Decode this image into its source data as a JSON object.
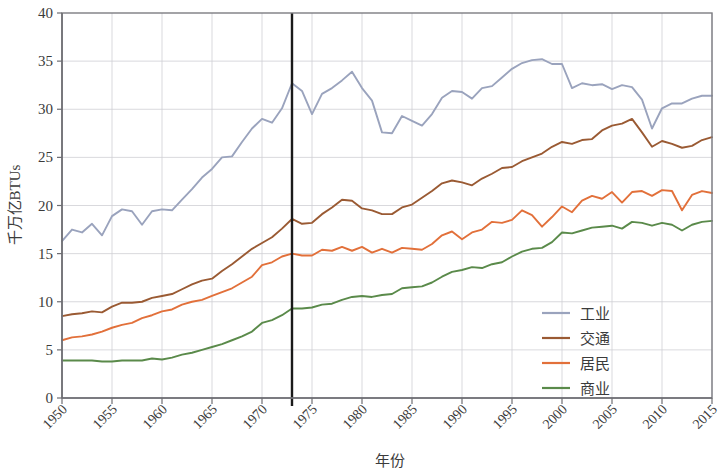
{
  "chart_data": {
    "type": "line",
    "title": "",
    "xlabel": "年份",
    "ylabel": "千万亿BTUs",
    "xlim": [
      1950,
      2015
    ],
    "ylim": [
      0,
      40
    ],
    "xticks": [
      1950,
      1955,
      1960,
      1965,
      1970,
      1975,
      1980,
      1985,
      1990,
      1995,
      2000,
      2005,
      2010,
      2015
    ],
    "yticks": [
      0,
      5,
      10,
      15,
      20,
      25,
      30,
      35,
      40
    ],
    "grid": true,
    "legend_position": "lower-right",
    "annotations": [
      {
        "type": "vline",
        "x": 1973,
        "label": "",
        "color": "#1a1a1a"
      }
    ],
    "x": [
      1950,
      1951,
      1952,
      1953,
      1954,
      1955,
      1956,
      1957,
      1958,
      1959,
      1960,
      1961,
      1962,
      1963,
      1964,
      1965,
      1966,
      1967,
      1968,
      1969,
      1970,
      1971,
      1972,
      1973,
      1974,
      1975,
      1976,
      1977,
      1978,
      1979,
      1980,
      1981,
      1982,
      1983,
      1984,
      1985,
      1986,
      1987,
      1988,
      1989,
      1990,
      1991,
      1992,
      1993,
      1994,
      1995,
      1996,
      1997,
      1998,
      1999,
      2000,
      2001,
      2002,
      2003,
      2004,
      2005,
      2006,
      2007,
      2008,
      2009,
      2010,
      2011,
      2012,
      2013,
      2014,
      2015
    ],
    "series": [
      {
        "name": "工业",
        "color": "#9aa3bd",
        "values": [
          16.3,
          17.5,
          17.2,
          18.1,
          16.9,
          18.9,
          19.6,
          19.4,
          18.0,
          19.4,
          19.6,
          19.5,
          20.6,
          21.7,
          22.9,
          23.8,
          25.0,
          25.1,
          26.6,
          28.0,
          29.0,
          28.6,
          30.1,
          32.7,
          31.9,
          29.5,
          31.6,
          32.2,
          33.0,
          33.9,
          32.2,
          30.9,
          27.6,
          27.5,
          29.3,
          28.8,
          28.3,
          29.5,
          31.2,
          31.9,
          31.8,
          31.1,
          32.2,
          32.4,
          33.3,
          34.2,
          34.8,
          35.1,
          35.2,
          34.7,
          34.7,
          32.2,
          32.7,
          32.5,
          32.6,
          32.1,
          32.5,
          32.3,
          31.0,
          28.0,
          30.1,
          30.6,
          30.6,
          31.1,
          31.4,
          31.4
        ]
      },
      {
        "name": "交通",
        "color": "#9a5a33",
        "values": [
          8.5,
          8.7,
          8.8,
          9.0,
          8.9,
          9.5,
          9.9,
          9.9,
          10.0,
          10.4,
          10.6,
          10.8,
          11.3,
          11.8,
          12.2,
          12.4,
          13.2,
          13.9,
          14.7,
          15.5,
          16.1,
          16.7,
          17.6,
          18.6,
          18.1,
          18.2,
          19.1,
          19.8,
          20.6,
          20.5,
          19.7,
          19.5,
          19.1,
          19.1,
          19.8,
          20.1,
          20.8,
          21.5,
          22.3,
          22.6,
          22.4,
          22.1,
          22.8,
          23.3,
          23.9,
          24.0,
          24.6,
          25.0,
          25.4,
          26.1,
          26.6,
          26.4,
          26.8,
          26.9,
          27.8,
          28.3,
          28.5,
          29.0,
          27.6,
          26.1,
          26.7,
          26.4,
          26.0,
          26.2,
          26.8,
          27.1
        ]
      },
      {
        "name": "居民",
        "color": "#e2703a",
        "values": [
          6.0,
          6.3,
          6.4,
          6.6,
          6.9,
          7.3,
          7.6,
          7.8,
          8.3,
          8.6,
          9.0,
          9.2,
          9.7,
          10.0,
          10.2,
          10.6,
          11.0,
          11.4,
          12.0,
          12.6,
          13.8,
          14.1,
          14.7,
          15.0,
          14.8,
          14.8,
          15.4,
          15.3,
          15.7,
          15.3,
          15.7,
          15.1,
          15.5,
          15.1,
          15.6,
          15.5,
          15.4,
          16.0,
          16.9,
          17.3,
          16.5,
          17.2,
          17.5,
          18.3,
          18.2,
          18.5,
          19.5,
          19.0,
          17.8,
          18.8,
          19.9,
          19.3,
          20.5,
          21.0,
          20.7,
          21.4,
          20.3,
          21.4,
          21.5,
          21.0,
          21.6,
          21.5,
          19.5,
          21.1,
          21.5,
          21.3
        ]
      },
      {
        "name": "商业",
        "color": "#5a8a4a",
        "values": [
          3.9,
          3.9,
          3.9,
          3.9,
          3.8,
          3.8,
          3.9,
          3.9,
          3.9,
          4.1,
          4.0,
          4.2,
          4.5,
          4.7,
          5.0,
          5.3,
          5.6,
          6.0,
          6.4,
          6.9,
          7.8,
          8.1,
          8.6,
          9.3,
          9.3,
          9.4,
          9.7,
          9.8,
          10.2,
          10.5,
          10.6,
          10.5,
          10.7,
          10.8,
          11.4,
          11.5,
          11.6,
          12.0,
          12.6,
          13.1,
          13.3,
          13.6,
          13.5,
          13.9,
          14.1,
          14.7,
          15.2,
          15.5,
          15.6,
          16.2,
          17.2,
          17.1,
          17.4,
          17.7,
          17.8,
          17.9,
          17.6,
          18.3,
          18.2,
          17.9,
          18.2,
          18.0,
          17.4,
          18.0,
          18.3,
          18.4
        ]
      }
    ]
  },
  "legend": {
    "items": [
      {
        "label": "工业",
        "color": "#9aa3bd"
      },
      {
        "label": "交通",
        "color": "#9a5a33"
      },
      {
        "label": "居民",
        "color": "#e2703a"
      },
      {
        "label": "商业",
        "color": "#5a8a4a"
      }
    ]
  },
  "axes": {
    "y_title": "千万亿BTUs",
    "x_title": "年份"
  }
}
